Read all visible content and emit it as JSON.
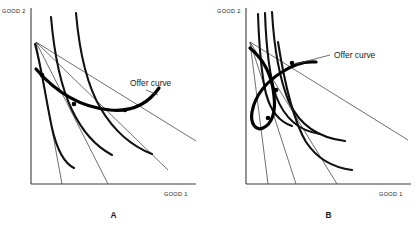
{
  "figure": {
    "title": "",
    "background_color": "#ffffff",
    "width": 420,
    "height": 231
  },
  "chart_data": {
    "type": "line",
    "title": "",
    "xlabel": "GOOD 1",
    "ylabel": "GOOD 2",
    "grid": false,
    "legend_position": "none",
    "panels": [
      {
        "id": "A",
        "letter": "A",
        "xlabel": "GOOD 1",
        "ylabel": "GOOD 2",
        "annotation": "Offer curve",
        "annotation_x": 130,
        "annotation_y": 86,
        "origin_x": 31,
        "origin_y": 184,
        "axis_top_y": 8,
        "axis_right_x": 196,
        "endowment_x": 36,
        "endowment_y": 42,
        "budget_lines": [
          {
            "x1": 36,
            "y1": 42,
            "x2": 62,
            "y2": 184
          },
          {
            "x1": 36,
            "y1": 42,
            "x2": 108,
            "y2": 184
          },
          {
            "x1": 36,
            "y1": 42,
            "x2": 168,
            "y2": 170
          },
          {
            "x1": 36,
            "y1": 42,
            "x2": 196,
            "y2": 141
          }
        ],
        "indifference_curves": [
          "M 35,44 C 42,70 46,100 52,128 C 57,150 64,163 74,168",
          "M 51,17 C 54,52 60,85 72,110 C 83,133 97,147 112,155",
          "M 76,13 C 79,48 86,84 101,109 C 116,134 134,147 152,154"
        ],
        "offer_curve": "M 36,69 C 54,90 78,107 110,110 C 132,112 148,104 159,88",
        "tangency_points": [
          {
            "x": 42,
            "y": 75
          },
          {
            "x": 74,
            "y": 104
          },
          {
            "x": 125,
            "y": 110
          }
        ],
        "leader_line": {
          "x1": 146,
          "y1": 90,
          "x2": 158,
          "y2": 95
        }
      },
      {
        "id": "B",
        "letter": "B",
        "xlabel": "GOOD 1",
        "ylabel": "GOOD 2",
        "annotation": "Offer curve",
        "annotation_x": 334,
        "annotation_y": 58,
        "origin_x": 246,
        "origin_y": 184,
        "axis_top_y": 8,
        "axis_right_x": 411,
        "endowment_x": 250,
        "endowment_y": 42,
        "budget_lines": [
          {
            "x1": 250,
            "y1": 42,
            "x2": 268,
            "y2": 184
          },
          {
            "x1": 250,
            "y1": 42,
            "x2": 296,
            "y2": 184
          },
          {
            "x1": 250,
            "y1": 42,
            "x2": 337,
            "y2": 184
          },
          {
            "x1": 250,
            "y1": 42,
            "x2": 408,
            "y2": 140
          }
        ],
        "indifference_curves": [
          "M 258,14 C 259,44 261,72 266,94 C 271,112 280,122 292,126",
          "M 265,13 C 266,44 269,74 276,96 C 285,120 300,131 320,134",
          "M 272,12 C 274,46 279,78 289,102 C 300,126 320,138 345,141",
          "M 278,42 C 284,80 292,118 306,142 C 318,160 336,168 352,170"
        ],
        "offer_curve": "M 250,48 C 262,58 272,74 274,96 C 276,112 272,124 263,128 C 256,131 250,124 252,112 C 255,96 266,82 282,72 C 294,64 306,61 316,62",
        "tangency_points": [
          {
            "x": 292,
            "y": 63
          },
          {
            "x": 276,
            "y": 90
          },
          {
            "x": 268,
            "y": 118
          }
        ],
        "leader_line": {
          "x1": 296,
          "y1": 64,
          "x2": 330,
          "y2": 55
        }
      }
    ]
  }
}
